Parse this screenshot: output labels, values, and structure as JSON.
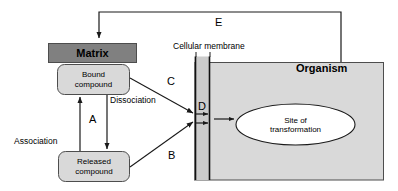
{
  "diagram": {
    "background_color": "#ffffff",
    "line_color": "#000000"
  },
  "nodes": {
    "matrix": {
      "label": "Matrix",
      "fill": "#808080",
      "shape": "rectangle"
    },
    "bound_compound": {
      "line1": "Bound",
      "line2": "compound",
      "fill": "#d9d9d9",
      "shape": "rounded-rectangle"
    },
    "released_compound": {
      "line1": "Released",
      "line2": "compound",
      "fill": "#d9d9d9",
      "shape": "rounded-rectangle"
    },
    "organism": {
      "label": "Organism",
      "fill": "#d9d9d9",
      "shape": "rectangle"
    },
    "site_of_transformation": {
      "line1": "Site of",
      "line2": "transformation",
      "fill": "#ffffff",
      "shape": "ellipse"
    },
    "cellular_membrane": {
      "label": "Cellular membrane",
      "fill": "#cccccc",
      "shape": "vertical-band"
    }
  },
  "edge_labels": {
    "association": "Association",
    "dissociation": "Dissociation",
    "a": "A",
    "b": "B",
    "c": "C",
    "d": "D",
    "e": "E"
  }
}
